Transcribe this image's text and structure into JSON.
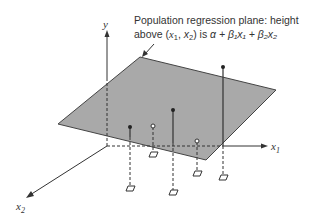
{
  "annotation": {
    "line1": "Population regression plane: height",
    "line2_prefix": "above (",
    "line2_x1": "x",
    "line2_x1_sub": "1",
    "line2_comma": ", ",
    "line2_x2": "x",
    "line2_x2_sub": "2",
    "line2_mid": ") is ",
    "line2_formula": "α + β₁x₁ + β₂x₂"
  },
  "axes": {
    "y_label": "y",
    "x1_label": "x",
    "x1_sub": "1",
    "x2_label": "x",
    "x2_sub": "2"
  },
  "colors": {
    "plane_fill": "#a8a8a8",
    "line": "#333333"
  }
}
